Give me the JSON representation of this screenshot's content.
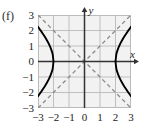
{
  "figure": {
    "part_label": "(f)",
    "x_axis_name": "x",
    "y_axis_name": "y"
  },
  "chart_data": {
    "type": "line",
    "title": "",
    "subtitle": "",
    "xlabel": "x",
    "ylabel": "y",
    "xlim": [
      -3,
      3
    ],
    "ylim": [
      -3,
      3
    ],
    "grid": true,
    "legend": "none",
    "annotations": [
      "(f)"
    ],
    "equation": "x^2/4 - y^2/4 = 1",
    "curve_kind": "hyperbola",
    "orientation": "horizontal",
    "center": [
      0,
      0
    ],
    "vertices": [
      [
        -2,
        0
      ],
      [
        2,
        0
      ]
    ],
    "a": 2,
    "b": 2,
    "xticks": [
      -3,
      -2,
      -1,
      0,
      1,
      2,
      3
    ],
    "yticks": [
      -3,
      -2,
      -1,
      0,
      1,
      2,
      3
    ],
    "xticklabels": [
      "−3",
      "−2",
      "−1",
      "0",
      "1",
      "2",
      "3"
    ],
    "yticklabels": [
      "−3",
      "−2",
      "−1",
      "0",
      "1",
      "2",
      "3"
    ],
    "series": [
      {
        "name": "right-branch",
        "style": "solid",
        "color": "#000000",
        "points": [
          [
            3.0,
            2.236
          ],
          [
            2.9,
            2.1
          ],
          [
            2.8,
            1.96
          ],
          [
            2.7,
            1.811
          ],
          [
            2.6,
            1.661
          ],
          [
            2.5,
            1.5
          ],
          [
            2.4,
            1.327
          ],
          [
            2.3,
            1.14
          ],
          [
            2.2,
            0.917
          ],
          [
            2.1,
            0.64
          ],
          [
            2.05,
            0.452
          ],
          [
            2.0,
            0.0
          ],
          [
            2.05,
            -0.452
          ],
          [
            2.1,
            -0.64
          ],
          [
            2.2,
            -0.917
          ],
          [
            2.3,
            -1.14
          ],
          [
            2.4,
            -1.327
          ],
          [
            2.5,
            -1.5
          ],
          [
            2.6,
            -1.661
          ],
          [
            2.7,
            -1.811
          ],
          [
            2.8,
            -1.96
          ],
          [
            2.9,
            -2.1
          ],
          [
            3.0,
            -2.236
          ]
        ]
      },
      {
        "name": "left-branch",
        "style": "solid",
        "color": "#000000",
        "points": [
          [
            -3.0,
            2.236
          ],
          [
            -2.9,
            2.1
          ],
          [
            -2.8,
            1.96
          ],
          [
            -2.7,
            1.811
          ],
          [
            -2.6,
            1.661
          ],
          [
            -2.5,
            1.5
          ],
          [
            -2.4,
            1.327
          ],
          [
            -2.3,
            1.14
          ],
          [
            -2.2,
            0.917
          ],
          [
            -2.1,
            0.64
          ],
          [
            -2.05,
            0.452
          ],
          [
            -2.0,
            0.0
          ],
          [
            -2.05,
            -0.452
          ],
          [
            -2.1,
            -0.64
          ],
          [
            -2.2,
            -0.917
          ],
          [
            -2.3,
            -1.14
          ],
          [
            -2.4,
            -1.327
          ],
          [
            -2.5,
            -1.5
          ],
          [
            -2.6,
            -1.661
          ],
          [
            -2.7,
            -1.811
          ],
          [
            -2.8,
            -1.96
          ],
          [
            -2.9,
            -2.1
          ],
          [
            -3.0,
            -2.236
          ]
        ]
      },
      {
        "name": "asymptote-positive",
        "style": "dashed",
        "color": "#8a8a8a",
        "equation": "y = x",
        "points": [
          [
            -3,
            -3
          ],
          [
            3,
            3
          ]
        ]
      },
      {
        "name": "asymptote-negative",
        "style": "dashed",
        "color": "#8a8a8a",
        "equation": "y = -x",
        "points": [
          [
            -3,
            3
          ],
          [
            3,
            -3
          ]
        ]
      }
    ]
  },
  "colors": {
    "panel_background": "#f2f2f2",
    "grid": "#b9b9b9",
    "axis": "#333333",
    "curve": "#000000",
    "asymptote": "#8a8a8a",
    "text": "#1c1c1c"
  }
}
